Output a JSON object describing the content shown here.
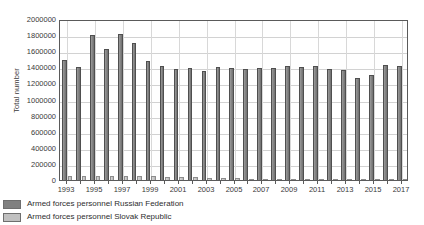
{
  "chart_data": {
    "type": "bar",
    "title": "",
    "subtitle": "",
    "xlabel": "",
    "ylabel": "Total number",
    "ylim": [
      0,
      2000000
    ],
    "ytick_step": 200000,
    "ytick_labels": [
      "2000000",
      "1800000",
      "1600000",
      "1400000",
      "1200000",
      "1000000",
      "800000",
      "600000",
      "400000",
      "200000",
      "0"
    ],
    "ytick_values": [
      2000000,
      1800000,
      1600000,
      1400000,
      1200000,
      1000000,
      800000,
      600000,
      400000,
      200000,
      0
    ],
    "grid": true,
    "grid_axis": "both",
    "legend_position": "below-left",
    "categories": [
      1993,
      1994,
      1995,
      1996,
      1997,
      1998,
      1999,
      2000,
      2001,
      2002,
      2003,
      2004,
      2005,
      2006,
      2007,
      2008,
      2009,
      2010,
      2011,
      2012,
      2013,
      2014,
      2015,
      2016,
      2017
    ],
    "xtick_labels": [
      "1993",
      "1995",
      "1997",
      "1999",
      "2001",
      "2003",
      "2005",
      "2007",
      "2009",
      "2011",
      "2013",
      "2015",
      "2017"
    ],
    "xtick_values": [
      1993,
      1995,
      1997,
      1999,
      2001,
      2003,
      2005,
      2007,
      2009,
      2011,
      2013,
      2015,
      2017
    ],
    "series": [
      {
        "name": "Armed forces personnel Russian Federation",
        "color": "#808080",
        "values": [
          1490000,
          1400000,
          1800000,
          1630000,
          1820000,
          1700000,
          1480000,
          1420000,
          1385000,
          1390000,
          1360000,
          1410000,
          1390000,
          1380000,
          1390000,
          1390000,
          1420000,
          1410000,
          1420000,
          1385000,
          1370000,
          1270000,
          1300000,
          1430000,
          1420000
        ]
      },
      {
        "name": "Armed forces personnel Slovak Republic",
        "color": "#c0c0c0",
        "values": [
          55000,
          52000,
          55000,
          50000,
          49000,
          48000,
          45000,
          41000,
          37000,
          33000,
          30000,
          25000,
          20000,
          17000,
          17000,
          17000,
          17000,
          16000,
          16000,
          16000,
          16000,
          16000,
          16000,
          16000,
          16000
        ]
      }
    ]
  },
  "legend": {
    "items": [
      {
        "label": "Armed forces personnel Russian Federation",
        "color": "#808080"
      },
      {
        "label": "Armed forces personnel Slovak Republic",
        "color": "#c0c0c0"
      }
    ]
  }
}
